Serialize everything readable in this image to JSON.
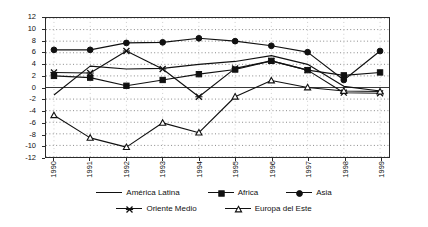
{
  "chart_data": {
    "type": "line",
    "title": "",
    "xlabel": "",
    "ylabel": "",
    "categories": [
      "1990",
      "1991",
      "1992",
      "1993",
      "1994",
      "1995",
      "1996",
      "1997",
      "1998",
      "1999"
    ],
    "ylim": [
      -12,
      12
    ],
    "ytick_step": 2,
    "yticks": [
      "12",
      "10",
      "8",
      "6",
      "4",
      "2",
      "0",
      "-2",
      "-4",
      "-6",
      "-8",
      "-10",
      "-12"
    ],
    "grid": true,
    "grid_style": "dotted-horizontal",
    "legend_position": "bottom",
    "series": [
      {
        "name": "América Latina",
        "marker": "none",
        "color": "#111111",
        "values": [
          -1.3,
          3.7,
          3.2,
          3.3,
          4.0,
          4.5,
          5.5,
          4.0,
          0.2,
          -0.6
        ]
      },
      {
        "name": "Africa",
        "marker": "square",
        "color": "#111111",
        "values": [
          2.0,
          1.7,
          0.3,
          1.3,
          2.3,
          3.1,
          4.6,
          3.0,
          2.1,
          2.6
        ]
      },
      {
        "name": "Asia",
        "marker": "circle",
        "color": "#111111",
        "values": [
          6.5,
          6.5,
          7.7,
          7.8,
          8.5,
          8.0,
          7.2,
          6.1,
          1.3,
          6.3
        ]
      },
      {
        "name": "Oriente Medio",
        "marker": "x",
        "color": "#111111",
        "values": [
          2.6,
          2.5,
          6.3,
          3.2,
          -1.6,
          3.3,
          4.6,
          3.0,
          -0.9,
          -1.0
        ]
      },
      {
        "name": "Europa del Este",
        "marker": "triangle",
        "color": "#111111",
        "values": [
          -4.8,
          -8.7,
          -10.3,
          -6.1,
          -7.8,
          -1.6,
          1.2,
          0.0,
          -0.6,
          -0.7
        ]
      }
    ]
  },
  "legend": {
    "row1": [
      {
        "label": "América Latina",
        "marker": "none"
      },
      {
        "label": "Africa",
        "marker": "square"
      },
      {
        "label": "Asia",
        "marker": "circle"
      }
    ],
    "row2": [
      {
        "label": "Oriente Medio",
        "marker": "x"
      },
      {
        "label": "Europa del Este",
        "marker": "triangle"
      }
    ]
  }
}
